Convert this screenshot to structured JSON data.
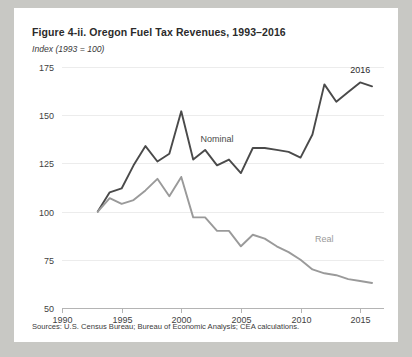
{
  "figure": {
    "title": "Figure 4-ii. Oregon Fuel Tax Revenues, 1993–2016",
    "subtitle": "Index (1993 = 100)",
    "source": "Sources: U.S. Census Bureau; Bureau of Economic Analysis; CEA calculations.",
    "end_annotation": "2016"
  },
  "colors": {
    "card_background": "#ffffff",
    "page_background": "#c8c8c4",
    "nominal_line": "#4a4a4a",
    "real_line": "#9a9a9a",
    "gridline": "#ececec",
    "axis": "#b4b4b4",
    "text": "#2b2b2b"
  },
  "chart_data": {
    "type": "line",
    "title": "Figure 4-ii. Oregon Fuel Tax Revenues, 1993–2016",
    "subtitle": "Index (1993 = 100)",
    "xlabel": "",
    "ylabel": "Index (1993 = 100)",
    "xlim": [
      1990,
      2017
    ],
    "ylim": [
      50,
      175
    ],
    "yticks": [
      50,
      75,
      100,
      125,
      150,
      175
    ],
    "xticks": [
      1990,
      1995,
      2000,
      2005,
      2010,
      2015
    ],
    "grid": true,
    "legend": "inline-labels",
    "x": [
      1993,
      1994,
      1995,
      1996,
      1997,
      1998,
      1999,
      2000,
      2001,
      2002,
      2003,
      2004,
      2005,
      2006,
      2007,
      2008,
      2009,
      2010,
      2011,
      2012,
      2013,
      2014,
      2015,
      2016
    ],
    "series": [
      {
        "name": "Nominal",
        "color": "#4a4a4a",
        "label_x": 2003,
        "label_y": 136,
        "values": [
          100,
          110,
          112,
          124,
          134,
          126,
          130,
          152,
          127,
          132,
          124,
          127,
          120,
          133,
          133,
          132,
          131,
          128,
          140,
          166,
          157,
          162,
          167,
          165
        ]
      },
      {
        "name": "Real",
        "color": "#9a9a9a",
        "label_x": 2012,
        "label_y": 84,
        "values": [
          100,
          107,
          104,
          106,
          111,
          117,
          108,
          118,
          97,
          97,
          90,
          90,
          82,
          88,
          86,
          82,
          79,
          75,
          70,
          68,
          67,
          65,
          64,
          63
        ]
      }
    ],
    "annotations": [
      {
        "text": "2016",
        "x": 2015,
        "y": 172
      }
    ]
  },
  "axis_labels": {
    "y": [
      "175",
      "150",
      "125",
      "100",
      "75",
      "50"
    ],
    "x": [
      "1990",
      "1995",
      "2000",
      "2005",
      "2010",
      "2015"
    ]
  }
}
